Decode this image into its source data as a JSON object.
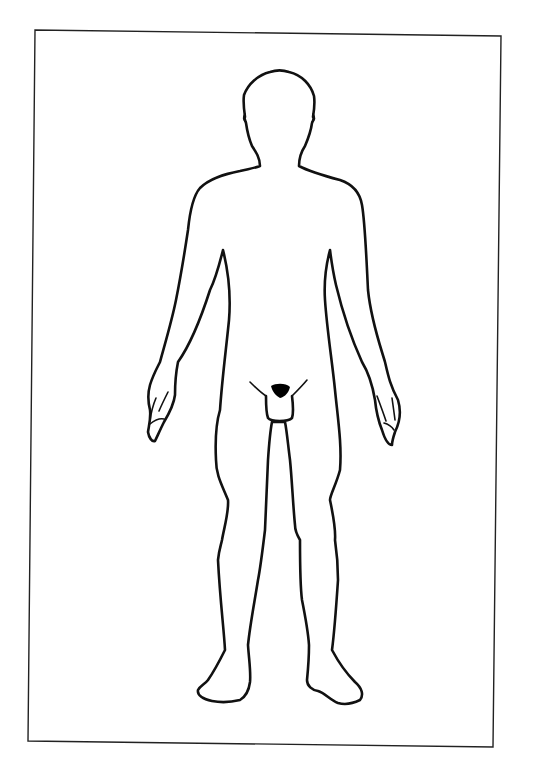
{
  "figure": {
    "type": "body-outline-diagram",
    "view": "anterior",
    "colors": {
      "background": "#ffffff",
      "line": "#111111",
      "frame": "#222222",
      "fill_mark": "#000000"
    },
    "parts": [
      "frame",
      "head",
      "neck",
      "torso",
      "left-arm",
      "right-arm",
      "left-hand",
      "right-hand",
      "groin",
      "left-leg",
      "right-leg",
      "left-foot",
      "right-foot"
    ]
  }
}
